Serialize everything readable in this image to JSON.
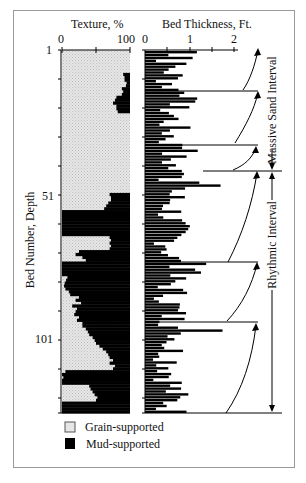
{
  "figure": {
    "texture_title": "Texture, %",
    "thickness_title": "Bed Thickness, Ft.",
    "texture_ticks": [
      "0",
      "100"
    ],
    "thickness_ticks": [
      "0",
      "1",
      "2"
    ],
    "y_axis_label": "Bed Number, Depth",
    "y_ticks": [
      "1",
      "51",
      "101"
    ],
    "intervals": [
      {
        "label": "Massive Sand Interval"
      },
      {
        "label": "Rhythmic Interval"
      }
    ],
    "legend": [
      {
        "label": "Grain-supported",
        "color": "#d9d9d9"
      },
      {
        "label": "Mud-supported",
        "color": "#000000"
      }
    ]
  },
  "chart_data": {
    "type": "bar",
    "title": "",
    "xlabel": "",
    "ylabel": "Bed Number, Depth",
    "panels": [
      {
        "name": "Texture",
        "xlabel": "Texture, %",
        "xlim": [
          0,
          100
        ],
        "orientation": "horizontal",
        "series": [
          {
            "name": "Grain-supported",
            "color": "#d9d9d9"
          },
          {
            "name": "Mud-supported",
            "color": "#000000"
          }
        ],
        "mud_percent_by_bed_approx": [
          0,
          0,
          0,
          0,
          0,
          0,
          0,
          0,
          10,
          8,
          8,
          5,
          6,
          12,
          10,
          12,
          20,
          22,
          25,
          20,
          20,
          18,
          0,
          0,
          0,
          0,
          0,
          0,
          0,
          0,
          0,
          0,
          0,
          0,
          0,
          0,
          0,
          0,
          0,
          0,
          0,
          0,
          0,
          0,
          0,
          0,
          0,
          0,
          0,
          0,
          30,
          28,
          28,
          32,
          35,
          38,
          100,
          100,
          100,
          100,
          100,
          100,
          100,
          100,
          100,
          30,
          28,
          30,
          28,
          30,
          75,
          80,
          70,
          65,
          100,
          100,
          100,
          100,
          100,
          92,
          94,
          96,
          97,
          95,
          90,
          88,
          75,
          80,
          72,
          85,
          78,
          80,
          82,
          75,
          78,
          70,
          70,
          65,
          62,
          60,
          55,
          52,
          50,
          45,
          40,
          35,
          32,
          30,
          25,
          30,
          22,
          25,
          95,
          100,
          98,
          100,
          100,
          60,
          58,
          55,
          52,
          48,
          50,
          100,
          100,
          100,
          100
        ]
      },
      {
        "name": "Bed Thickness",
        "xlabel": "Bed Thickness, Ft.",
        "xlim": [
          0,
          2.5
        ],
        "orientation": "horizontal",
        "series": [
          {
            "name": "Thickness",
            "color": "#000000"
          }
        ]
      }
    ],
    "y_ticks": [
      1,
      51,
      101
    ],
    "legend": [
      "Grain-supported",
      "Mud-supported"
    ],
    "legend_position": "bottom-left",
    "annotations": [
      "Massive Sand Interval",
      "Rhythmic Interval",
      "thinning-upward cycle arrows"
    ]
  }
}
